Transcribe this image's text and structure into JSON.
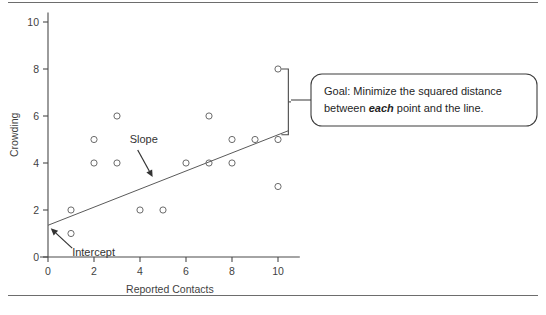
{
  "figure": {
    "background_color": "#ffffff",
    "rule_color": "#6d6d6d",
    "point_color": "#6b6b6b",
    "line_color": "#5a5a5a",
    "text_color": "#333333"
  },
  "chart_data": {
    "type": "scatter",
    "title": "",
    "xlabel": "Reported Contacts",
    "ylabel": "Crowding",
    "xlim": [
      0,
      10.6
    ],
    "ylim": [
      0,
      10.4
    ],
    "xticks": [
      0,
      2,
      4,
      6,
      8,
      10
    ],
    "yticks": [
      0,
      2,
      4,
      6,
      8,
      10
    ],
    "xtick_labels": [
      "0",
      "2",
      "4",
      "6",
      "8",
      "10"
    ],
    "ytick_labels": [
      "0",
      "2",
      "4",
      "6",
      "8",
      "10"
    ],
    "grid": false,
    "legend": false,
    "points": [
      {
        "x": 1,
        "y": 2
      },
      {
        "x": 1,
        "y": 1
      },
      {
        "x": 2,
        "y": 5
      },
      {
        "x": 2,
        "y": 4
      },
      {
        "x": 3,
        "y": 6
      },
      {
        "x": 3,
        "y": 4
      },
      {
        "x": 4,
        "y": 2
      },
      {
        "x": 5,
        "y": 2
      },
      {
        "x": 6,
        "y": 4
      },
      {
        "x": 7,
        "y": 6
      },
      {
        "x": 7,
        "y": 4
      },
      {
        "x": 8,
        "y": 5
      },
      {
        "x": 8,
        "y": 4
      },
      {
        "x": 9,
        "y": 5
      },
      {
        "x": 10,
        "y": 8
      },
      {
        "x": 10,
        "y": 5
      },
      {
        "x": 10,
        "y": 3
      }
    ],
    "fit_line": {
      "intercept": 1.35,
      "slope": 0.385,
      "x_start": 0,
      "x_end": 10.45
    },
    "annotations": [
      {
        "name": "slope",
        "label": "Slope",
        "text_x": 3.55,
        "text_y": 4.85,
        "arrow_from_x": 3.9,
        "arrow_from_y": 4.55,
        "arrow_to_x": 4.55,
        "arrow_to_y": 3.4
      },
      {
        "name": "intercept",
        "label": "Intercept",
        "text_x": 1.05,
        "text_y": 0.05,
        "arrow_from_x": 1.05,
        "arrow_from_y": 0.38,
        "arrow_to_x": 0.12,
        "arrow_to_y": 1.22
      }
    ],
    "bracket": {
      "x": 10.45,
      "y_top": 8.0,
      "y_bottom": 5.2
    }
  },
  "callout": {
    "line1_prefix": "Goal: Minimize the squared distance",
    "line2_prefix": "between ",
    "line2_emphasis": "each",
    "line2_suffix": " point and the line."
  }
}
